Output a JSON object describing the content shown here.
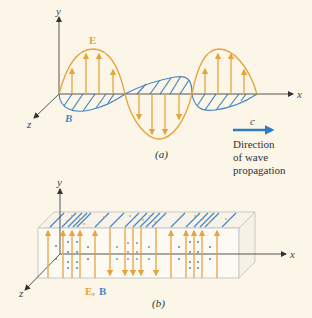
{
  "colors": {
    "background": "#fbf6e7",
    "e_field": "#e8a33c",
    "b_field": "#4a86c5",
    "axis": "#555555",
    "box_edge": "#c8c8c8"
  },
  "part_a": {
    "label": "(a)",
    "axes": {
      "x": "x",
      "y": "y",
      "z": "z"
    },
    "e_label": "E",
    "b_label": "B",
    "propagation": {
      "speed_label": "c",
      "text_lines": [
        "Direction",
        "of wave",
        "propagation"
      ]
    }
  },
  "part_b": {
    "label": "(b)",
    "axes": {
      "x": "x",
      "y": "y",
      "z": "z"
    },
    "legend_e": "E,",
    "legend_b": "B"
  }
}
